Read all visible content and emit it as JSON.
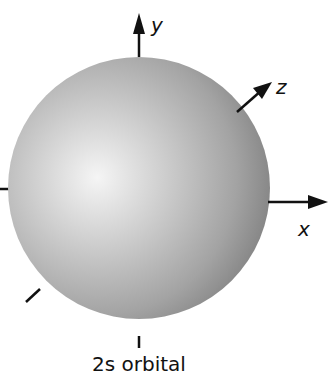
{
  "diagram": {
    "caption": "2s orbital",
    "axes": {
      "x_label": "x",
      "y_label": "y",
      "z_label": "z"
    },
    "colors": {
      "sphere_highlight": "#f4f4f4",
      "sphere_mid": "#b4b4b4",
      "sphere_edge": "#808080",
      "axis": "#111111",
      "background": "#ffffff"
    }
  }
}
